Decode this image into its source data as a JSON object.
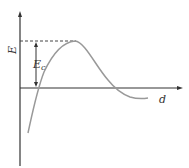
{
  "diagram": {
    "type": "potential-energy-curve",
    "y_axis_label": "E",
    "x_axis_label": "d",
    "barrier_label_main": "E",
    "barrier_label_sub": "c",
    "colors": {
      "axes": "#333333",
      "curve": "#999999",
      "dashed": "#444444",
      "text": "#333333"
    }
  }
}
